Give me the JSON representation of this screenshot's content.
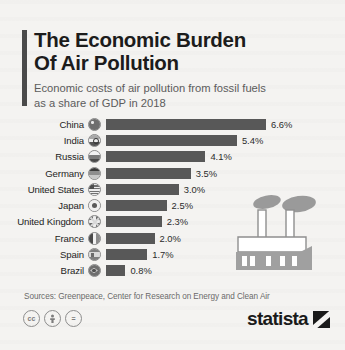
{
  "header": {
    "title_line1": "The Economic Burden",
    "title_line2": "Of Air Pollution",
    "subtitle_line1": "Economic costs of air pollution from fossil fuels",
    "subtitle_line2": "as a share of GDP in 2018"
  },
  "chart_data": {
    "type": "bar",
    "orientation": "horizontal",
    "title": "The Economic Burden Of Air Pollution",
    "subtitle": "Economic costs of air pollution from fossil fuels as a share of GDP in 2018",
    "xlabel": "",
    "ylabel": "",
    "xlim": [
      0,
      6.6
    ],
    "grid": false,
    "legend": false,
    "unit": "%",
    "categories": [
      "China",
      "India",
      "Russia",
      "Germany",
      "United States",
      "Japan",
      "United Kingdom",
      "France",
      "Spain",
      "Brazil"
    ],
    "values": [
      6.6,
      5.4,
      4.1,
      3.5,
      3.0,
      2.5,
      2.3,
      2.0,
      1.7,
      0.8
    ],
    "value_labels": [
      "6.6%",
      "5.4%",
      "4.1%",
      "3.5%",
      "3.0%",
      "2.5%",
      "2.3%",
      "2.0%",
      "1.7%",
      "0.8%"
    ],
    "bar_color": "#585858"
  },
  "rows": [
    {
      "label": "China",
      "value": 6.6,
      "value_label": "6.6%",
      "flag": "flag-icon-china"
    },
    {
      "label": "India",
      "value": 5.4,
      "value_label": "5.4%",
      "flag": "flag-icon-india"
    },
    {
      "label": "Russia",
      "value": 4.1,
      "value_label": "4.1%",
      "flag": "flag-icon-russia"
    },
    {
      "label": "Germany",
      "value": 3.5,
      "value_label": "3.5%",
      "flag": "flag-icon-germany"
    },
    {
      "label": "United States",
      "value": 3.0,
      "value_label": "3.0%",
      "flag": "flag-icon-united-states"
    },
    {
      "label": "Japan",
      "value": 2.5,
      "value_label": "2.5%",
      "flag": "flag-icon-japan"
    },
    {
      "label": "United Kingdom",
      "value": 2.3,
      "value_label": "2.3%",
      "flag": "flag-icon-united-kingdom"
    },
    {
      "label": "France",
      "value": 2.0,
      "value_label": "2.0%",
      "flag": "flag-icon-france"
    },
    {
      "label": "Spain",
      "value": 1.7,
      "value_label": "1.7%",
      "flag": "flag-icon-spain"
    },
    {
      "label": "Brazil",
      "value": 0.8,
      "value_label": "0.8%",
      "flag": "flag-icon-brazil"
    }
  ],
  "illustration": {
    "name": "factory-with-smoke-illustration"
  },
  "footer": {
    "sources": "Sources: Greenpeace, Center for Research on Energy and Clean Air",
    "license_icons": [
      "cc",
      "by",
      "nd"
    ],
    "license_glyphs": [
      "cc",
      "ᵁ",
      "="
    ],
    "brand": "statista"
  },
  "colors": {
    "background": "#f4f3f1",
    "bar": "#585858",
    "accent": "#4a4a4a",
    "title": "#1c1c1c",
    "subtitle": "#5c5c5c"
  }
}
